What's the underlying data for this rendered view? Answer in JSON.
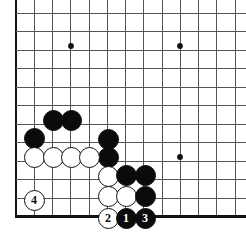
{
  "figure": {
    "kind": "go-board-diagram",
    "width": 246,
    "height": 240,
    "background_color": "#ffffff",
    "line_color": "#555555",
    "edge_color": "#111111",
    "black_color": "#0b0b0b",
    "white_color": "#ffffff"
  },
  "board": {
    "geometry": {
      "origin_x": 16,
      "origin_y": 13,
      "cell_width": 18.25,
      "cell_height": 18.5,
      "columns_visible": 13,
      "rows_visible": 12,
      "left_edge_is_board_border": true,
      "bottom_edge_is_board_border": true,
      "top_edge_is_cut_off": true,
      "right_edge_is_cut_off": true,
      "stone_diameter": 21
    },
    "star_points": [
      {
        "name": "hoshi-upper-left",
        "x": 71,
        "y": 46
      },
      {
        "name": "hoshi-upper-right",
        "x": 180,
        "y": 46
      },
      {
        "name": "hoshi-lower-right",
        "x": 180,
        "y": 157
      }
    ],
    "stones": [
      {
        "name": "black-stone-c3r7",
        "color": "black",
        "x": 53,
        "y": 120,
        "label": ""
      },
      {
        "name": "black-stone-c4r7",
        "color": "black",
        "x": 71,
        "y": 120,
        "label": ""
      },
      {
        "name": "black-stone-c2r8",
        "color": "black",
        "x": 34,
        "y": 138,
        "label": ""
      },
      {
        "name": "black-stone-c6r8",
        "color": "black",
        "x": 108,
        "y": 139,
        "label": ""
      },
      {
        "name": "black-stone-c6r9",
        "color": "black",
        "x": 108,
        "y": 157,
        "label": ""
      },
      {
        "name": "white-stone-c2r9",
        "color": "white",
        "x": 34,
        "y": 157,
        "label": ""
      },
      {
        "name": "white-stone-c3r9",
        "color": "white",
        "x": 53,
        "y": 157,
        "label": ""
      },
      {
        "name": "white-stone-c4r9",
        "color": "white",
        "x": 71,
        "y": 157,
        "label": ""
      },
      {
        "name": "white-stone-c5r9",
        "color": "white",
        "x": 89,
        "y": 157,
        "label": ""
      },
      {
        "name": "white-stone-c6r10",
        "color": "white",
        "x": 108,
        "y": 176,
        "label": ""
      },
      {
        "name": "black-stone-c7r10",
        "color": "black",
        "x": 126,
        "y": 175,
        "label": ""
      },
      {
        "name": "black-stone-c8r10",
        "color": "black",
        "x": 145,
        "y": 175,
        "label": ""
      },
      {
        "name": "white-stone-move-4",
        "color": "white",
        "x": 34,
        "y": 200,
        "label": "4"
      },
      {
        "name": "white-stone-c6r11",
        "color": "white",
        "x": 108,
        "y": 196,
        "label": ""
      },
      {
        "name": "white-stone-c7r11",
        "color": "white",
        "x": 126,
        "y": 196,
        "label": ""
      },
      {
        "name": "black-stone-c8r11",
        "color": "black",
        "x": 145,
        "y": 196,
        "label": ""
      },
      {
        "name": "white-stone-move-2",
        "color": "white",
        "x": 108,
        "y": 218,
        "label": "2"
      },
      {
        "name": "black-stone-move-1",
        "color": "black",
        "x": 126,
        "y": 218,
        "label": "1"
      },
      {
        "name": "black-stone-move-3",
        "color": "black",
        "x": 145,
        "y": 218,
        "label": "3"
      }
    ],
    "move_sequence": [
      {
        "number": "1",
        "color": "black"
      },
      {
        "number": "2",
        "color": "white"
      },
      {
        "number": "3",
        "color": "black"
      },
      {
        "number": "4",
        "color": "white"
      }
    ]
  }
}
